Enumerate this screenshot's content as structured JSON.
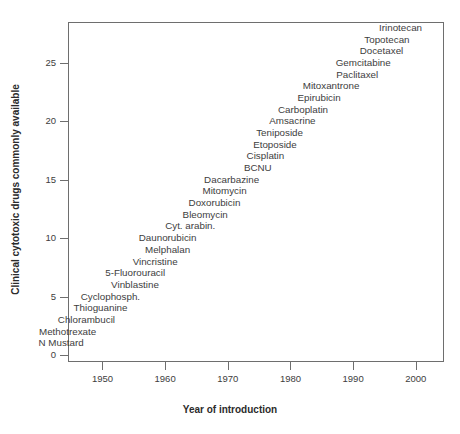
{
  "chart_data": {
    "type": "scatter",
    "title": "",
    "xlabel": "Year of introduction",
    "ylabel": "Clinical cytotoxic drugs commonly available",
    "xlim": [
      1944.5,
      2004.5
    ],
    "ylim": [
      -0.6,
      28.5
    ],
    "xticks": [
      1950,
      1960,
      1970,
      1980,
      1990,
      2000
    ],
    "yticks": [
      0,
      5,
      10,
      15,
      20,
      25
    ],
    "grid": false,
    "legend": null,
    "labels_only": true,
    "points": [
      {
        "label": "N Mustard",
        "x": 1947,
        "y": 1
      },
      {
        "label": "Methotrexate",
        "x": 1949,
        "y": 2
      },
      {
        "label": "Chlorambucil",
        "x": 1952,
        "y": 3
      },
      {
        "label": "Thioguanine",
        "x": 1954,
        "y": 4
      },
      {
        "label": "Cyclophosph.",
        "x": 1956,
        "y": 5
      },
      {
        "label": "Vinblastine",
        "x": 1959,
        "y": 6
      },
      {
        "label": "5-Fluorouracil",
        "x": 1960,
        "y": 7
      },
      {
        "label": "Vincristine",
        "x": 1962,
        "y": 8
      },
      {
        "label": "Melphalan",
        "x": 1964,
        "y": 9
      },
      {
        "label": "Daunorubicin",
        "x": 1965,
        "y": 10
      },
      {
        "label": "Cyt. arabin.",
        "x": 1968,
        "y": 11
      },
      {
        "label": "Bleomycin",
        "x": 1970,
        "y": 12
      },
      {
        "label": "Doxorubicin",
        "x": 1972,
        "y": 13
      },
      {
        "label": "Mitomycin",
        "x": 1973,
        "y": 14
      },
      {
        "label": "Dacarbazine",
        "x": 1975,
        "y": 15
      },
      {
        "label": "BCNU",
        "x": 1977,
        "y": 16
      },
      {
        "label": "Cisplatin",
        "x": 1979,
        "y": 17
      },
      {
        "label": "Etoposide",
        "x": 1981,
        "y": 18
      },
      {
        "label": "Teniposide",
        "x": 1982,
        "y": 19
      },
      {
        "label": "Amsacrine",
        "x": 1984,
        "y": 20
      },
      {
        "label": "Carboplatin",
        "x": 1986,
        "y": 21
      },
      {
        "label": "Epirubicin",
        "x": 1988,
        "y": 22
      },
      {
        "label": "Mitoxantrone",
        "x": 1991,
        "y": 23
      },
      {
        "label": "Paclitaxel",
        "x": 1994,
        "y": 24
      },
      {
        "label": "Gemcitabine",
        "x": 1996,
        "y": 25
      },
      {
        "label": "Docetaxel",
        "x": 1998,
        "y": 26
      },
      {
        "label": "Topotecan",
        "x": 1999,
        "y": 27
      },
      {
        "label": "Irinotecan",
        "x": 2001,
        "y": 28
      }
    ]
  },
  "colors": {
    "background": "#ffffff",
    "axis": "#6e6e6e",
    "text": "#3d3d3d",
    "axis_title": "#2b2b2b"
  }
}
